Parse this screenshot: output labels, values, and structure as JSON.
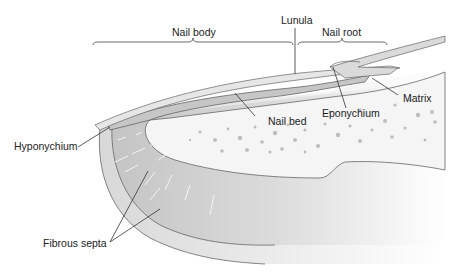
{
  "diagram": {
    "labels": {
      "lunula": "Lunula",
      "nail_body": "Nail body",
      "nail_root": "Nail root",
      "matrix": "Matrix",
      "eponychium": "Eponychium",
      "nail_bed": "Nail bed",
      "hyponychium": "Hyponychium",
      "fibrous_septa": "Fibrous septa"
    },
    "colors": {
      "nail_plate": "#e4e4e4",
      "nail_bed": "#c9c9c9",
      "soft_tissue": "#d4d4d4",
      "bone": "#f4f4f4",
      "bone_dots": "#bdbdbd",
      "outline": "#555555",
      "leader": "#333333"
    }
  }
}
